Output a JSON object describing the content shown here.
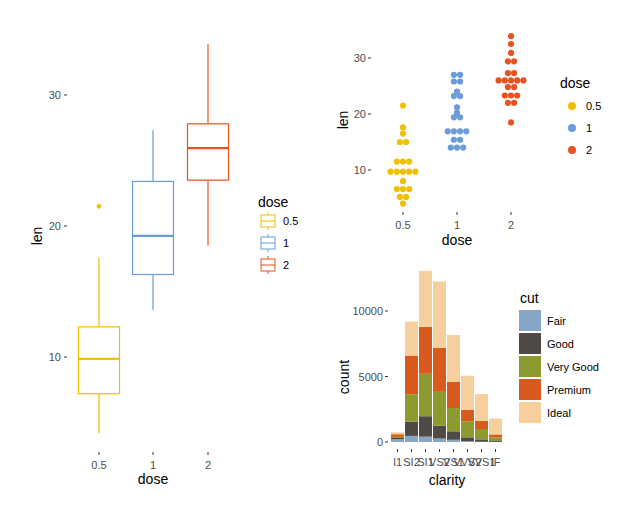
{
  "chart_data": [
    {
      "id": "boxplot",
      "type": "box",
      "title": "",
      "xlabel": "dose",
      "ylabel": "len",
      "categories": [
        "0.5",
        "1",
        "2"
      ],
      "yticks": [
        10,
        20,
        30
      ],
      "ylim": [
        3,
        36
      ],
      "grid": false,
      "legend": {
        "title": "dose",
        "position": "right",
        "entries": [
          "0.5",
          "1",
          "2"
        ]
      },
      "colors": [
        "#EFC000",
        "#6B9BD8",
        "#E8521E"
      ],
      "boxes": [
        {
          "dose": "0.5",
          "whisker_low": 4.2,
          "q1": 7.2,
          "median": 9.85,
          "q3": 12.3,
          "whisker_high": 17.6,
          "outliers": [
            21.5
          ]
        },
        {
          "dose": "1",
          "whisker_low": 13.6,
          "q1": 16.3,
          "median": 19.25,
          "q3": 23.4,
          "whisker_high": 27.3,
          "outliers": []
        },
        {
          "dose": "2",
          "whisker_low": 18.5,
          "q1": 23.5,
          "median": 25.95,
          "q3": 27.8,
          "whisker_high": 33.9,
          "outliers": []
        }
      ]
    },
    {
      "id": "dotplot",
      "type": "dotplot",
      "title": "",
      "xlabel": "dose",
      "ylabel": "len",
      "categories": [
        "0.5",
        "1",
        "2"
      ],
      "yticks": [
        10,
        20,
        30
      ],
      "grid": false,
      "legend": {
        "title": "dose",
        "position": "right",
        "entries": [
          "0.5",
          "1",
          "2"
        ]
      },
      "colors": [
        "#EFC000",
        "#6B9BD8",
        "#E8521E"
      ],
      "stacks": [
        {
          "dose": "0.5",
          "rows": [
            {
              "len": 21.5,
              "n": 1
            },
            {
              "len": 17.6,
              "n": 1
            },
            {
              "len": 16.5,
              "n": 1
            },
            {
              "len": 15.0,
              "n": 2
            },
            {
              "len": 11.5,
              "n": 3
            },
            {
              "len": 9.7,
              "n": 5
            },
            {
              "len": 8.0,
              "n": 1
            },
            {
              "len": 6.6,
              "n": 3
            },
            {
              "len": 5.2,
              "n": 2
            },
            {
              "len": 4.0,
              "n": 1
            }
          ]
        },
        {
          "dose": "1",
          "rows": [
            {
              "len": 27.0,
              "n": 2
            },
            {
              "len": 25.8,
              "n": 2
            },
            {
              "len": 24.0,
              "n": 1
            },
            {
              "len": 23.2,
              "n": 2
            },
            {
              "len": 21.2,
              "n": 1
            },
            {
              "len": 20.2,
              "n": 1
            },
            {
              "len": 19.4,
              "n": 2
            },
            {
              "len": 16.9,
              "n": 4
            },
            {
              "len": 15.4,
              "n": 2
            },
            {
              "len": 14.0,
              "n": 3
            }
          ]
        },
        {
          "dose": "2",
          "rows": [
            {
              "len": 33.9,
              "n": 1
            },
            {
              "len": 32.5,
              "n": 1
            },
            {
              "len": 30.9,
              "n": 1
            },
            {
              "len": 29.4,
              "n": 2
            },
            {
              "len": 27.3,
              "n": 2
            },
            {
              "len": 26.0,
              "n": 5
            },
            {
              "len": 24.8,
              "n": 2
            },
            {
              "len": 23.3,
              "n": 3
            },
            {
              "len": 22.0,
              "n": 2
            },
            {
              "len": 18.5,
              "n": 1
            }
          ]
        }
      ]
    },
    {
      "id": "stacked-bar",
      "type": "bar",
      "stacked": true,
      "title": "",
      "xlabel": "clarity",
      "ylabel": "count",
      "categories": [
        "I1",
        "SI2",
        "SI1",
        "VS2",
        "VS1",
        "VVS2",
        "VVS1",
        "IF"
      ],
      "yticks": [
        0,
        5000,
        10000
      ],
      "ylim": [
        0,
        13500
      ],
      "grid": false,
      "legend": {
        "title": "cut",
        "position": "right",
        "entries": [
          "Fair",
          "Good",
          "Very Good",
          "Premium",
          "Ideal"
        ]
      },
      "series": [
        {
          "name": "Fair",
          "color": "#86A6C8",
          "values": [
            210,
            466,
            408,
            261,
            170,
            69,
            17,
            9
          ]
        },
        {
          "name": "Good",
          "color": "#4F4A45",
          "values": [
            96,
            1081,
            1560,
            978,
            648,
            286,
            186,
            71
          ]
        },
        {
          "name": "Very Good",
          "color": "#8C9A2F",
          "values": [
            84,
            2100,
            3240,
            2591,
            1775,
            1235,
            789,
            268
          ]
        },
        {
          "name": "Premium",
          "color": "#D85A1C",
          "values": [
            205,
            2949,
            3575,
            3357,
            1989,
            870,
            616,
            230
          ]
        },
        {
          "name": "Ideal",
          "color": "#F6CF9C",
          "values": [
            146,
            2598,
            4282,
            5071,
            3589,
            2606,
            2047,
            1212
          ]
        }
      ]
    }
  ]
}
